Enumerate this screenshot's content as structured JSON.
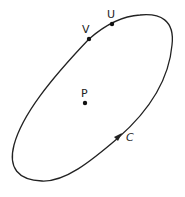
{
  "diagram": {
    "curve": {
      "label": "C",
      "color": "#222222"
    },
    "points": [
      {
        "id": "U",
        "label": "U"
      },
      {
        "id": "V",
        "label": "V"
      },
      {
        "id": "P",
        "label": "P"
      }
    ]
  }
}
